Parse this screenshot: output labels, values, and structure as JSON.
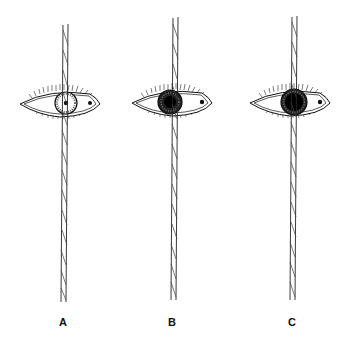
{
  "figure": {
    "panels": [
      {
        "label": "A",
        "pupil": "small",
        "iris_dark": false,
        "rod_covers": "center of iris"
      },
      {
        "label": "B",
        "pupil": "medium",
        "iris_dark": true,
        "rod_covers": "center of pupil"
      },
      {
        "label": "C",
        "pupil": "large",
        "iris_dark": true,
        "rod_covers": "nasal edge of iris"
      }
    ],
    "colors": {
      "ink": "#111111",
      "background": "#ffffff"
    }
  }
}
